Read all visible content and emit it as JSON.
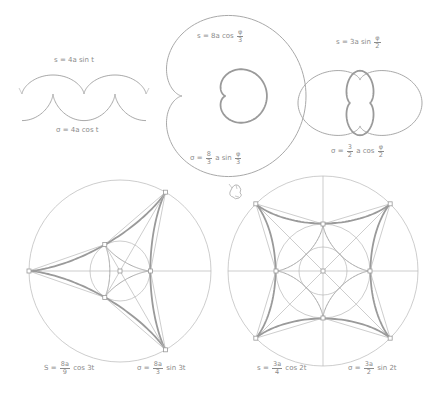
{
  "colors": {
    "background": "#ffffff",
    "curve_thin": "#b8b8b8",
    "curve_thick": "#9a9a9a",
    "label_text": "#8a8a8a"
  },
  "figures": {
    "cycloid": {
      "label_top": {
        "lhs": "s",
        "eq": "=",
        "rhs": "4a sin t"
      },
      "label_bottom": {
        "lhs": "σ",
        "eq": "=",
        "rhs": "4a cos t"
      },
      "arch_width": 62,
      "arch_height": 19,
      "base_y": 94,
      "start_x": 22,
      "arches": 2
    },
    "cardioid": {
      "label_top": {
        "lhs": "s",
        "eq": "=",
        "rhs_pre": "8a cos",
        "num": "φ",
        "den": "3"
      },
      "label_bottom": {
        "lhs": "σ",
        "eq": "=",
        "num_a": "8",
        "den_a": "3",
        "mid": "a sin",
        "num": "φ",
        "den": "3"
      },
      "center": [
        213,
        96
      ],
      "outer_scale": 31,
      "inner_scale": 10.3
    },
    "nephroid": {
      "label_top": {
        "lhs": "s",
        "eq": "=",
        "rhs_pre": "3a sin",
        "num": "φ",
        "den": "2"
      },
      "label_bottom": {
        "lhs": "σ",
        "eq": "=",
        "num_a": "3",
        "den_a": "2",
        "mid": "a cos",
        "num": "φ",
        "den": "2"
      },
      "center": [
        360,
        103
      ],
      "outer_scale": 15.5,
      "inner_scale": 5.2
    },
    "deltoid": {
      "label_s": {
        "lhs": "S",
        "eq": "=",
        "num_a": "8a",
        "den_a": "9",
        "rhs": "cos 3t"
      },
      "label_sigma": {
        "lhs": "σ",
        "eq": "=",
        "num_a": "8a",
        "den_a": "3",
        "rhs": "sin 3t"
      },
      "center": [
        120,
        271
      ],
      "outer_radius": 91,
      "inner_circle_radius": 30
    },
    "astroid": {
      "label_s": {
        "lhs": "s",
        "eq": "=",
        "num_a": "3a",
        "den_a": "4",
        "rhs": "cos 2t"
      },
      "label_sigma": {
        "lhs": "σ",
        "eq": "=",
        "num_a": "3a",
        "den_a": "2",
        "rhs": "sin 2t"
      },
      "center": [
        323,
        271
      ],
      "outer_radius": 95,
      "mid_circle_radius": 47,
      "small_circle_radius": 24
    }
  }
}
